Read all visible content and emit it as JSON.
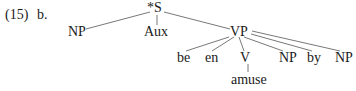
{
  "example": {
    "number": "(15)",
    "sublabel": "b."
  },
  "tree": {
    "root": "*S",
    "nodes": {
      "np_subject": "NP",
      "aux": "Aux",
      "vp": "VP",
      "be": "be",
      "en": "en",
      "v": "V",
      "np_object": "NP",
      "by": "by",
      "np_agent": "NP",
      "amuse": "amuse"
    },
    "edges": [
      [
        "*S",
        "NP"
      ],
      [
        "*S",
        "Aux"
      ],
      [
        "*S",
        "VP"
      ],
      [
        "VP",
        "be"
      ],
      [
        "VP",
        "en"
      ],
      [
        "VP",
        "V"
      ],
      [
        "VP",
        "NP"
      ],
      [
        "VP",
        "by"
      ],
      [
        "VP",
        "NP"
      ],
      [
        "V",
        "amuse"
      ]
    ]
  }
}
